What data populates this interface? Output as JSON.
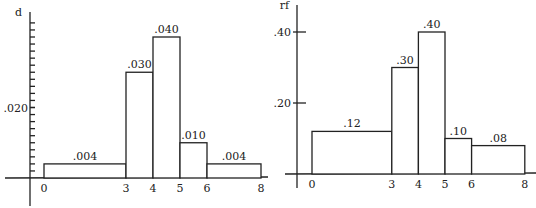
{
  "chart_data": [
    {
      "type": "bar",
      "subtype": "histogram",
      "title": "",
      "ylabel": "d",
      "xlabel": "",
      "bins": [
        [
          0,
          3
        ],
        [
          3,
          4
        ],
        [
          4,
          5
        ],
        [
          5,
          6
        ],
        [
          6,
          8
        ]
      ],
      "values": [
        0.004,
        0.03,
        0.04,
        0.01,
        0.004
      ],
      "value_labels": [
        ".004",
        ".030",
        ".040",
        ".010",
        ".004"
      ],
      "x_ticks": [
        0,
        3,
        4,
        5,
        6,
        8
      ],
      "x_tick_labels": [
        "0",
        "3",
        "4",
        "5",
        "6",
        "8"
      ],
      "y_ticks_minor_step": 0.002,
      "y_tick_labels": [
        {
          "value": 0.02,
          "label": ".020"
        }
      ],
      "ylim": [
        0,
        0.044
      ],
      "grid": false
    },
    {
      "type": "bar",
      "subtype": "histogram",
      "title": "",
      "ylabel": "rf",
      "xlabel": "",
      "bins": [
        [
          0,
          3
        ],
        [
          3,
          4
        ],
        [
          4,
          5
        ],
        [
          5,
          6
        ],
        [
          6,
          8
        ]
      ],
      "values": [
        0.12,
        0.3,
        0.4,
        0.1,
        0.08
      ],
      "value_labels": [
        ".12",
        ".30",
        ".40",
        ".10",
        ".08"
      ],
      "x_ticks": [
        0,
        3,
        4,
        5,
        6,
        8
      ],
      "x_tick_labels": [
        "0",
        "3",
        "4",
        "5",
        "6",
        "8"
      ],
      "y_tick_labels": [
        {
          "value": 0.2,
          "label": ".20"
        },
        {
          "value": 0.4,
          "label": ".40"
        }
      ],
      "ylim": [
        0,
        0.48
      ],
      "grid": false
    }
  ]
}
